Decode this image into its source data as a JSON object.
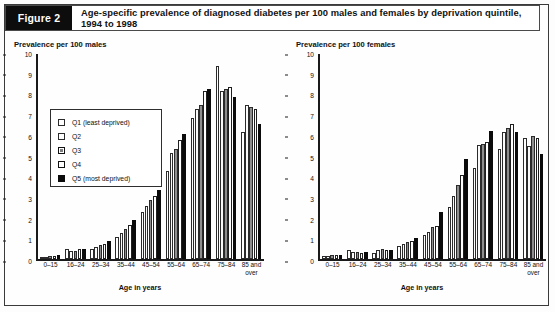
{
  "figure": {
    "tag": "Figure 2",
    "title": "Age-specific prevalence of diagnosed diabetes per 100 males and females by deprivation quintile, 1994 to 1998"
  },
  "legend": {
    "items": [
      {
        "key": "q1",
        "label": "Q1 (least deprived)"
      },
      {
        "key": "q2",
        "label": "Q2"
      },
      {
        "key": "q3",
        "label": "Q3"
      },
      {
        "key": "q4",
        "label": "Q4"
      },
      {
        "key": "q5",
        "label": "Q5 (most deprived)"
      }
    ]
  },
  "panels": {
    "male": {
      "title": "Prevalence per 100 males"
    },
    "female": {
      "title": "Prevalence per 100 females"
    }
  },
  "chart_data": [
    {
      "type": "bar",
      "title": "Prevalence per 100 males",
      "xlabel": "Age in years",
      "ylabel": "Prevalence per 100 males",
      "ylim": [
        0,
        10
      ],
      "yticks": [
        0,
        1,
        2,
        3,
        4,
        5,
        6,
        7,
        8,
        9,
        10
      ],
      "grid": false,
      "legend_position": "upper-left",
      "categories": [
        "0–15",
        "16–24",
        "25–34",
        "35–44",
        "45–54",
        "55–64",
        "65–74",
        "75–84",
        "85 and over"
      ],
      "series": [
        {
          "name": "Q1 (least deprived)",
          "values": [
            0.1,
            0.5,
            0.5,
            1.1,
            2.3,
            4.3,
            6.9,
            9.4,
            6.2
          ]
        },
        {
          "name": "Q2",
          "values": [
            0.1,
            0.4,
            0.6,
            1.3,
            2.6,
            5.2,
            7.3,
            8.2,
            7.5
          ]
        },
        {
          "name": "Q3",
          "values": [
            0.15,
            0.4,
            0.7,
            1.5,
            2.9,
            5.4,
            7.5,
            8.3,
            7.4
          ]
        },
        {
          "name": "Q4",
          "values": [
            0.15,
            0.5,
            0.75,
            1.7,
            3.1,
            5.8,
            8.2,
            8.4,
            7.3
          ]
        },
        {
          "name": "Q5 (most deprived)",
          "values": [
            0.2,
            0.5,
            0.9,
            1.9,
            3.4,
            6.1,
            8.3,
            7.9,
            6.6
          ]
        }
      ]
    },
    {
      "type": "bar",
      "title": "Prevalence per 100 females",
      "xlabel": "Age in years",
      "ylabel": "Prevalence per 100 females",
      "ylim": [
        0,
        10
      ],
      "yticks": [
        0,
        1,
        2,
        3,
        4,
        5,
        6,
        7,
        8,
        9,
        10
      ],
      "grid": false,
      "legend_position": "none",
      "categories": [
        "0–15",
        "16–24",
        "25–34",
        "35–44",
        "45–54",
        "55–64",
        "65–74",
        "75–84",
        "85 and over"
      ],
      "series": [
        {
          "name": "Q1 (least deprived)",
          "values": [
            0.15,
            0.45,
            0.3,
            0.65,
            1.2,
            2.55,
            4.45,
            5.4,
            5.9
          ]
        },
        {
          "name": "Q2",
          "values": [
            0.15,
            0.35,
            0.45,
            0.75,
            1.35,
            3.1,
            5.55,
            6.2,
            5.5
          ]
        },
        {
          "name": "Q3",
          "values": [
            0.2,
            0.35,
            0.5,
            0.85,
            1.6,
            3.6,
            5.6,
            6.4,
            6.0
          ]
        },
        {
          "name": "Q4",
          "values": [
            0.2,
            0.3,
            0.45,
            0.9,
            1.65,
            4.1,
            5.7,
            6.6,
            5.9
          ]
        },
        {
          "name": "Q5 (most deprived)",
          "values": [
            0.2,
            0.35,
            0.45,
            1.05,
            2.3,
            4.9,
            6.25,
            6.2,
            5.15
          ]
        }
      ]
    }
  ],
  "axis": {
    "xlabel": "Age in years"
  }
}
